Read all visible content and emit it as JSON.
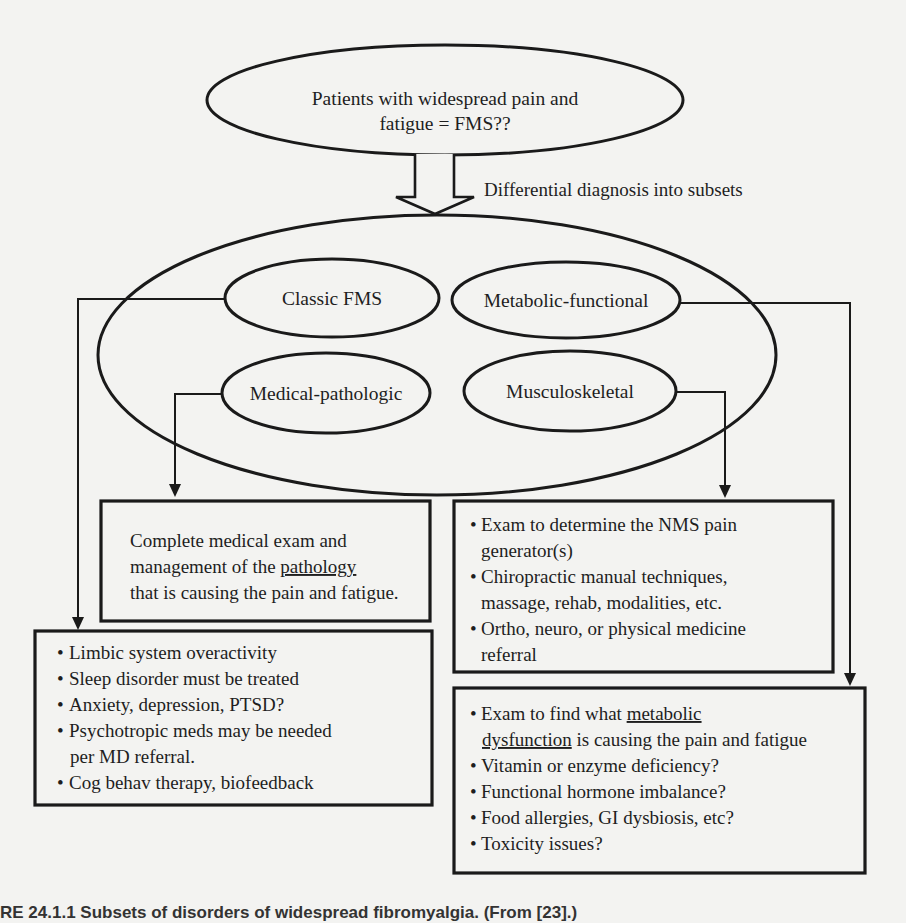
{
  "diagram": {
    "top_node": {
      "line1": "Patients with widespread pain and",
      "line2": "fatigue = FMS??"
    },
    "transition_label": "Differential diagnosis into subsets",
    "subsets": {
      "classic": "Classic FMS",
      "metabolic": "Metabolic-functional",
      "medical": "Medical-pathologic",
      "musculoskeletal": "Musculoskeletal"
    },
    "boxes": {
      "medical": {
        "lines": [
          {
            "text": "Complete medical exam and"
          },
          {
            "pre": "management of the ",
            "underlined": "pathology",
            "post": ""
          },
          {
            "text": "that is causing the pain and fatigue."
          }
        ]
      },
      "musculoskeletal": {
        "bullets": [
          {
            "line1": "Exam to determine the NMS pain",
            "line2": "generator(s)"
          },
          {
            "line1": "Chiropractic manual techniques,",
            "line2": "massage, rehab, modalities, etc."
          },
          {
            "line1": "Ortho, neuro, or physical medicine",
            "line2": "referral"
          }
        ]
      },
      "classic": {
        "bullets": [
          {
            "line1": "Limbic system overactivity"
          },
          {
            "line1": "Sleep disorder must be treated"
          },
          {
            "line1": "Anxiety, depression, PTSD?"
          },
          {
            "line1": "Psychotropic meds may be needed",
            "line2": "per MD referral."
          },
          {
            "line1": "Cog behav therapy, biofeedback"
          }
        ]
      },
      "metabolic": {
        "bullet1": {
          "pre": "Exam to find what ",
          "underlined1": "metabolic",
          "underlined2": "dysfunction",
          "post": " is causing the pain and fatigue"
        },
        "bullets": [
          {
            "line1": "Vitamin or enzyme deficiency?"
          },
          {
            "line1": "Functional hormone imbalance?"
          },
          {
            "line1": "Food allergies, GI dysbiosis, etc?"
          },
          {
            "line1": "Toxicity issues?"
          }
        ]
      }
    },
    "bullet_glyph": "•"
  },
  "caption": "RE 24.1.1   Subsets of disorders of widespread fibromyalgia. (From [23].)"
}
